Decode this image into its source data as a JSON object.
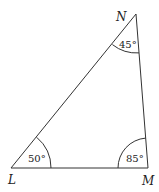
{
  "diagram": {
    "type": "triangle",
    "vertices": [
      {
        "name": "L",
        "x": 11,
        "y": 168,
        "angle": "50°"
      },
      {
        "name": "M",
        "x": 148,
        "y": 168,
        "angle": "85°"
      },
      {
        "name": "N",
        "x": 136,
        "y": 14,
        "angle": "45°"
      }
    ],
    "labels": {
      "L": "L",
      "M": "M",
      "N": "N"
    },
    "angles": {
      "L": "50°",
      "M": "85°",
      "N": "45°"
    },
    "stroke_color": "#333333"
  }
}
